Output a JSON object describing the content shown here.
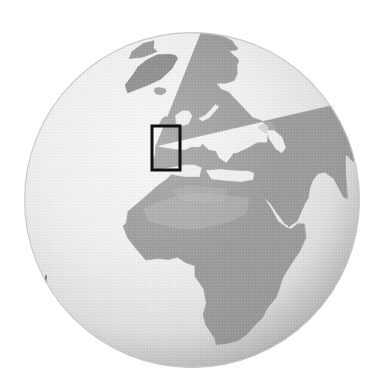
{
  "figure": {
    "kind": "globe-orthographic-map",
    "title": "Orthographic globe view of Europe, Africa and western Asia",
    "background_color": "#ffffff",
    "width": 386,
    "height": 389
  },
  "globe": {
    "center_x": 192,
    "center_y": 200,
    "radius": 168,
    "projection": "orthographic",
    "center_longitude": 8,
    "center_latitude": 26,
    "ocean_color": "#efefef",
    "ocean_shade_color": "#b8b8b8",
    "land_color": "#9a9a9a",
    "land_dark_color": "#7e7e7e",
    "land_light_color": "#b5b5b5",
    "limb_shadow_color": "#8d8d8d",
    "outline_color": "#c9c9c9"
  },
  "highlight_box": {
    "label": "British Isles region of interest",
    "x": 152,
    "y": 126,
    "width": 28,
    "height": 44,
    "stroke_color": "#111111",
    "stroke_width": 3,
    "fill": "none"
  },
  "landmasses": [
    {
      "name": "greenland",
      "label": "Greenland",
      "tone": "land_dark"
    },
    {
      "name": "iceland",
      "label": "Iceland",
      "tone": "land"
    },
    {
      "name": "scandinavia",
      "label": "Scandinavia",
      "tone": "land"
    },
    {
      "name": "british-isles",
      "label": "British Isles",
      "tone": "land"
    },
    {
      "name": "europe",
      "label": "Continental Europe",
      "tone": "land"
    },
    {
      "name": "iberia",
      "label": "Iberian Peninsula",
      "tone": "land"
    },
    {
      "name": "italy",
      "label": "Italy",
      "tone": "land"
    },
    {
      "name": "africa",
      "label": "Africa",
      "tone": "land"
    },
    {
      "name": "sahara",
      "label": "Sahara",
      "tone": "land_light"
    },
    {
      "name": "arabia",
      "label": "Arabian Peninsula",
      "tone": "land"
    },
    {
      "name": "asia",
      "label": "Western and Central Asia",
      "tone": "land"
    },
    {
      "name": "caspian-sea",
      "label": "Caspian Sea",
      "tone": "ocean"
    },
    {
      "name": "black-sea",
      "label": "Black Sea",
      "tone": "ocean"
    },
    {
      "name": "mediterranean-sea",
      "label": "Mediterranean Sea",
      "tone": "ocean"
    },
    {
      "name": "north-atlantic",
      "label": "North Atlantic Ocean",
      "tone": "ocean"
    }
  ],
  "chart_data": {
    "type": "map",
    "projection": "orthographic",
    "view_center": {
      "lon": 8,
      "lat": 26
    },
    "pixel_center": {
      "x": 192,
      "y": 200
    },
    "pixel_radius": 168,
    "grid": false,
    "legend": "none",
    "annotations": [
      {
        "name": "british-isles-box",
        "type": "rectangle",
        "lon_range": [
          -11,
          3
        ],
        "lat_range": [
          49,
          61
        ],
        "pixel_rect": {
          "x": 152,
          "y": 126,
          "w": 28,
          "h": 44
        },
        "color": "#111111"
      }
    ],
    "coastline_regions": [
      "Greenland",
      "Iceland",
      "Scandinavia",
      "British Isles",
      "Continental Europe",
      "Iberia",
      "Italy",
      "North Africa",
      "Sub-Saharan Africa",
      "Arabia",
      "Western Asia"
    ],
    "tones": {
      "ocean": "#efefef",
      "land": "#9a9a9a",
      "land_dark": "#7e7e7e",
      "land_light": "#b5b5b5"
    }
  }
}
